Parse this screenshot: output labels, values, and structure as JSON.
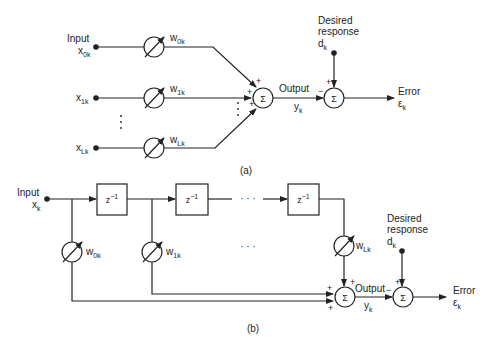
{
  "diagram_a": {
    "caption": "(a)",
    "input_label": "Input",
    "inputs": [
      {
        "name": "x",
        "sub": "0k"
      },
      {
        "name": "x",
        "sub": "1k"
      },
      {
        "name": "x",
        "sub": "Lk"
      }
    ],
    "weights": [
      {
        "name": "w",
        "sub": "0k"
      },
      {
        "name": "w",
        "sub": "1k"
      },
      {
        "name": "w",
        "sub": "Lk"
      }
    ],
    "sum_symbol": "Σ",
    "plus": "+",
    "minus": "−",
    "output_label": "Output",
    "output_var": {
      "name": "y",
      "sub": "k"
    },
    "desired_label_1": "Desired",
    "desired_label_2": "response",
    "desired_var": {
      "name": "d",
      "sub": "k"
    },
    "error_label": "Error",
    "error_var": {
      "name": "ε",
      "sub": "k"
    },
    "ellipsis_vertical": "⋮"
  },
  "diagram_b": {
    "caption": "(b)",
    "input_label": "Input",
    "input_var": {
      "name": "x",
      "sub": "k"
    },
    "delay_label": "z",
    "delay_exp": "−1",
    "weights": [
      {
        "name": "w",
        "sub": "0k"
      },
      {
        "name": "w",
        "sub": "1k"
      },
      {
        "name": "w",
        "sub": "Lk"
      }
    ],
    "ellipsis": "· · ·",
    "sum_symbol": "Σ",
    "plus": "+",
    "minus": "−",
    "output_label": "Output",
    "output_var": {
      "name": "y",
      "sub": "k"
    },
    "desired_label_1": "Desired",
    "desired_label_2": "response",
    "desired_var": {
      "name": "d",
      "sub": "k"
    },
    "error_label": "Error",
    "error_var": {
      "name": "ε",
      "sub": "k"
    }
  }
}
